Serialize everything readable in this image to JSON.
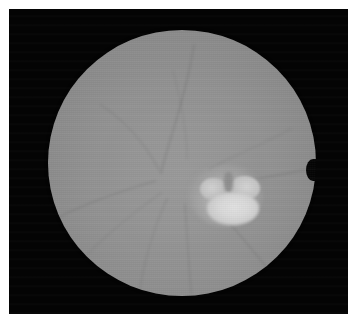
{
  "image": {
    "kind": "retinal-fundus-photograph",
    "modality_label": "Fundus photograph",
    "color_mode": "grayscale",
    "caption": "",
    "width_px": 354,
    "height_px": 322
  },
  "frame": {
    "border_color": "#ffffff",
    "background_color": "#040404",
    "x": 9,
    "y": 9,
    "width": 339,
    "height": 305
  },
  "fundus_field": {
    "label": "circular field of view",
    "center_x": 182,
    "center_y": 163,
    "radius": 134,
    "fill_color": "#909090",
    "rim_color": "#7e7e7e"
  },
  "rim_notch": {
    "label": "right rim notch artifact",
    "x": 306,
    "y": 159,
    "width": 14,
    "height": 22,
    "color": "#050505"
  },
  "optic_disc": {
    "label": "optic disc",
    "center_x": 186,
    "center_y": 177,
    "width": 62,
    "height": 48,
    "cup_color": "#d8d8d8",
    "rim_color": "#c0c0c0",
    "lobes": [
      {
        "name": "superonasal-lobe",
        "x": 161,
        "y": 157
      },
      {
        "name": "superotemporal-lobe",
        "x": 197,
        "y": 158
      },
      {
        "name": "inferior-cup",
        "x": 185,
        "y": 188
      }
    ]
  },
  "vessels": {
    "label": "retinal vessel arcades",
    "stroke_color": "#7b7b7b",
    "paths": [
      {
        "name": "superior-temporal-arcade",
        "d": "M152,164 C160,130 176,92 185,36"
      },
      {
        "name": "superior-nasal-arcade",
        "d": "M150,161 C136,134 116,112 92,96"
      },
      {
        "name": "nasal-arcade",
        "d": "M146,172 C112,182 72,196 38,214"
      },
      {
        "name": "inferior-nasal-arcade",
        "d": "M158,190 C146,216 136,248 130,284"
      },
      {
        "name": "inferior-arcade",
        "d": "M176,196 C178,226 180,252 182,284"
      },
      {
        "name": "inferior-temporal-arcade",
        "d": "M203,193 C224,218 246,244 266,268"
      },
      {
        "name": "temporal-arcade",
        "d": "M207,175 C238,172 272,166 300,160"
      },
      {
        "name": "superior-temporal-branch",
        "d": "M200,160 C222,148 252,136 282,120"
      },
      {
        "name": "fine-branch-upper",
        "d": "M178,150 C178,120 172,92 164,62"
      },
      {
        "name": "fine-branch-lower-left",
        "d": "M152,184 C124,204 96,226 72,252"
      }
    ],
    "widths": [
      1.6,
      1.3,
      1.5,
      1.3,
      1.5,
      1.5,
      1.6,
      1.2,
      1.1,
      1.1
    ],
    "opacities": [
      0.55,
      0.45,
      0.5,
      0.42,
      0.5,
      0.5,
      0.55,
      0.38,
      0.32,
      0.34
    ]
  },
  "chart_data": null
}
